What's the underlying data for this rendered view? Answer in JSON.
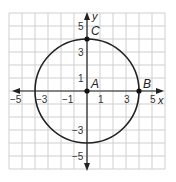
{
  "figure": {
    "grid": {
      "xmin": -6,
      "xmax": 6,
      "ymin": -6,
      "ymax": 6,
      "color": "#cfcfcf"
    },
    "axes": {
      "x_label": "x",
      "y_label": "y",
      "color": "#222222"
    },
    "x_ticks": [
      {
        "value": -5,
        "label": "−5"
      },
      {
        "value": -3,
        "label": "−3"
      },
      {
        "value": -1,
        "label": "−1"
      },
      {
        "value": 1,
        "label": "1"
      },
      {
        "value": 3,
        "label": "3"
      },
      {
        "value": 5,
        "label": "5"
      }
    ],
    "y_ticks": [
      {
        "value": 5,
        "label": "5"
      },
      {
        "value": 3,
        "label": "3"
      },
      {
        "value": 1,
        "label": "1"
      },
      {
        "value": -3,
        "label": "−3"
      },
      {
        "value": -5,
        "label": "−5"
      }
    ],
    "circle": {
      "center": [
        0,
        0
      ],
      "radius": 4,
      "color": "#222222"
    },
    "points": [
      {
        "name": "A",
        "x": 0,
        "y": 0
      },
      {
        "name": "B",
        "x": 4,
        "y": 0
      },
      {
        "name": "C",
        "x": 0,
        "y": 4
      }
    ]
  }
}
